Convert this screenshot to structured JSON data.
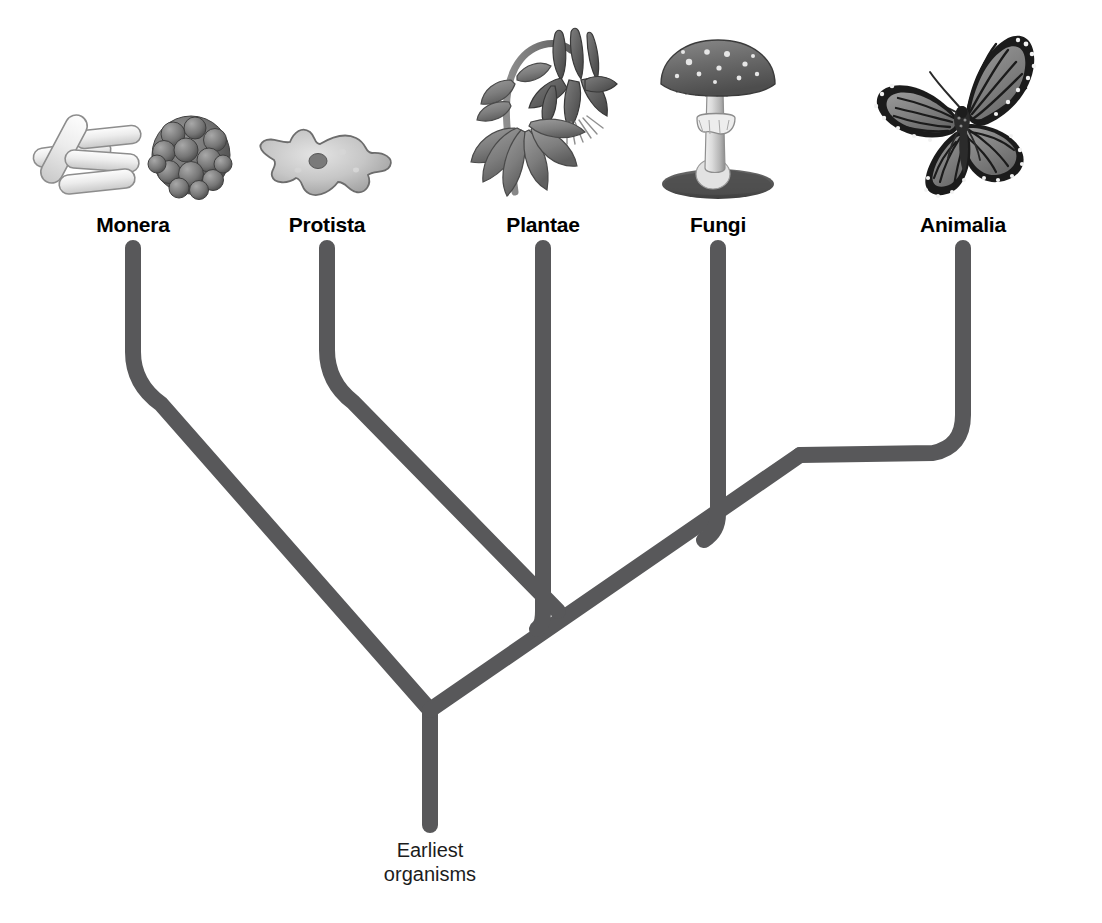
{
  "diagram": {
    "type": "phylogenetic-tree",
    "branch_color": "#58585a",
    "background_color": "#ffffff",
    "stroke_width": 16
  },
  "kingdoms": [
    {
      "label": "Monera",
      "icon": "bacteria-icon",
      "tip_x": 133,
      "tip_y": 248,
      "label_x": 133,
      "label_y": 214
    },
    {
      "label": "Protista",
      "icon": "amoeba-icon",
      "tip_x": 327,
      "tip_y": 248,
      "label_x": 327,
      "label_y": 214
    },
    {
      "label": "Plantae",
      "icon": "flower-icon",
      "tip_x": 543,
      "tip_y": 248,
      "label_x": 543,
      "label_y": 214
    },
    {
      "label": "Fungi",
      "icon": "mushroom-icon",
      "tip_x": 718,
      "tip_y": 248,
      "label_x": 718,
      "label_y": 214
    },
    {
      "label": "Animalia",
      "icon": "butterfly-icon",
      "tip_x": 963,
      "tip_y": 248,
      "label_x": 963,
      "label_y": 214
    }
  ],
  "root": {
    "label_line1": "Earliest",
    "label_line2": "organisms",
    "x": 430,
    "y": 838,
    "stem_top_y": 710,
    "stem_bottom_y": 825
  },
  "nodes": [
    {
      "name": "root-node",
      "x": 430,
      "y": 710
    },
    {
      "name": "plantae-node",
      "x": 540,
      "y": 625
    },
    {
      "name": "fungi-node",
      "x": 688,
      "y": 530
    },
    {
      "name": "animalia-node",
      "x": 800,
      "y": 455
    },
    {
      "name": "protista-node",
      "x": 327,
      "y": 375
    }
  ]
}
